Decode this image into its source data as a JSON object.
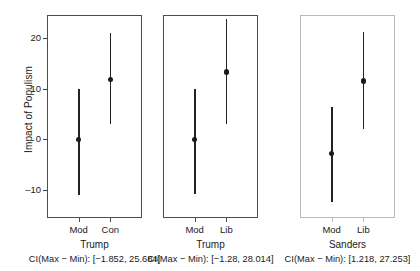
{
  "chart_data": {
    "type": "scatter",
    "title": "",
    "ylabel": "Impact of Populism",
    "xlabel": "",
    "ylim": [
      -15.5,
      24.5
    ],
    "yticks": [
      20,
      10,
      0,
      -10
    ],
    "ytick_labels": [
      "20",
      "10",
      "0",
      "–10"
    ],
    "grid": false,
    "legend": null,
    "panels": [
      {
        "group_label": "Trump",
        "caption": "CI(Max − Min): [−1.852, 25.684]",
        "muted": false,
        "categories": [
          "Mod",
          "Con"
        ],
        "points": [
          {
            "category": "Mod",
            "estimate": 0.0,
            "ci_low": -11.0,
            "ci_high": 10.0
          },
          {
            "category": "Con",
            "estimate": 11.8,
            "ci_low": 3.1,
            "ci_high": 20.9
          }
        ]
      },
      {
        "group_label": "Trump",
        "caption": "CI(Max − Min): [−1.28, 28.014]",
        "muted": false,
        "categories": [
          "Mod",
          "Lib"
        ],
        "points": [
          {
            "category": "Mod",
            "estimate": 0.0,
            "ci_low": -10.7,
            "ci_high": 9.9
          },
          {
            "category": "Lib",
            "estimate": 13.3,
            "ci_low": 3.1,
            "ci_high": 23.8
          }
        ]
      },
      {
        "group_label": "Sanders",
        "caption": "CI(Max − Min): [1.218, 27.253]",
        "muted": true,
        "categories": [
          "Mod",
          "Lib"
        ],
        "points": [
          {
            "category": "Mod",
            "estimate": -2.8,
            "ci_low": -12.3,
            "ci_high": 6.3
          },
          {
            "category": "Lib",
            "estimate": 11.5,
            "ci_low": 2.0,
            "ci_high": 21.2
          }
        ]
      }
    ]
  },
  "colors": {
    "foreground": "#1a1a1a",
    "axis": "#4d4d4d",
    "muted": "#bdbdbd",
    "background": "#ffffff"
  }
}
